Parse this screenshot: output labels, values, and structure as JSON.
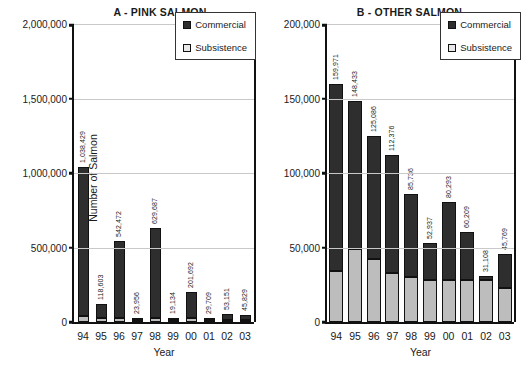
{
  "figure": {
    "panels": [
      {
        "id": "A",
        "title": "A - PINK SALMON",
        "xlabel": "Year",
        "ylabel": "Number of Salmon",
        "legend": {
          "commercial": "Commercial",
          "subsistence": "Subsistence"
        },
        "yticks": [
          "0",
          "500,000",
          "1,000,000",
          "1,500,000",
          "2,000,000"
        ]
      },
      {
        "id": "B",
        "title": "B - OTHER SALMON",
        "xlabel": "Year",
        "ylabel": "",
        "legend": {
          "commercial": "Commercial",
          "subsistence": "Subsistence"
        },
        "yticks": [
          "0",
          "50,000",
          "100,000",
          "150,000",
          "200,000"
        ]
      }
    ]
  },
  "colors": {
    "commercial": "#2e2e2e",
    "subsistence": "#bdbdbd",
    "axis": "#111111",
    "grid": "#c9c9c9",
    "background": "#ffffff"
  },
  "chart_data": [
    {
      "type": "bar",
      "stacked": true,
      "title": "A - PINK SALMON",
      "xlabel": "Year",
      "ylabel": "Number of Salmon",
      "ylim": [
        0,
        2000000
      ],
      "yticks": [
        0,
        500000,
        1000000,
        1500000,
        2000000
      ],
      "ytick_labels": [
        "0",
        "500,000",
        "1,000,000",
        "1,500,000",
        "2,000,000"
      ],
      "grid": true,
      "legend": [
        "Commercial",
        "Subsistence"
      ],
      "legend_position": "top-right",
      "categories": [
        "94",
        "95",
        "96",
        "97",
        "98",
        "99",
        "00",
        "01",
        "02",
        "03"
      ],
      "series": [
        {
          "name": "Commercial",
          "values": [
            998429,
            88603,
            512472,
            8956,
            599687,
            6134,
            171692,
            14709,
            38151,
            30829
          ]
        },
        {
          "name": "Subsistence",
          "values": [
            40000,
            30000,
            30000,
            15000,
            30000,
            13000,
            30000,
            15000,
            15000,
            15000
          ]
        }
      ],
      "data_labels": [
        "1,038,429",
        "118,603",
        "542,472",
        "23,956",
        "629,687",
        "19,134",
        "201,692",
        "29,709",
        "53,151",
        "45,829"
      ],
      "totals": [
        1038429,
        118603,
        542472,
        23956,
        629687,
        19134,
        201692,
        29709,
        53151,
        45829
      ]
    },
    {
      "type": "bar",
      "stacked": true,
      "title": "B - OTHER SALMON",
      "xlabel": "Year",
      "ylabel": "",
      "ylim": [
        0,
        200000
      ],
      "yticks": [
        0,
        50000,
        100000,
        150000,
        200000
      ],
      "ytick_labels": [
        "0",
        "50,000",
        "100,000",
        "150,000",
        "200,000"
      ],
      "grid": true,
      "legend": [
        "Commercial",
        "Subsistence"
      ],
      "legend_position": "top-right",
      "categories": [
        "94",
        "95",
        "96",
        "97",
        "98",
        "99",
        "00",
        "01",
        "02",
        "03"
      ],
      "series": [
        {
          "name": "Commercial",
          "values": [
            125971,
            99433,
            83086,
            79376,
            55736,
            24937,
            52293,
            32209,
            3108,
            22769
          ]
        },
        {
          "name": "Subsistence",
          "values": [
            34000,
            49000,
            42000,
            33000,
            30000,
            28000,
            28000,
            28000,
            28000,
            23000
          ]
        }
      ],
      "data_labels": [
        "159,971",
        "148,433",
        "125,086",
        "112,376",
        "85,736",
        "52,937",
        "80,293",
        "60,209",
        "31,108",
        "45,769"
      ],
      "totals": [
        159971,
        148433,
        125086,
        112376,
        85736,
        52937,
        80293,
        60209,
        31108,
        45769
      ]
    }
  ]
}
